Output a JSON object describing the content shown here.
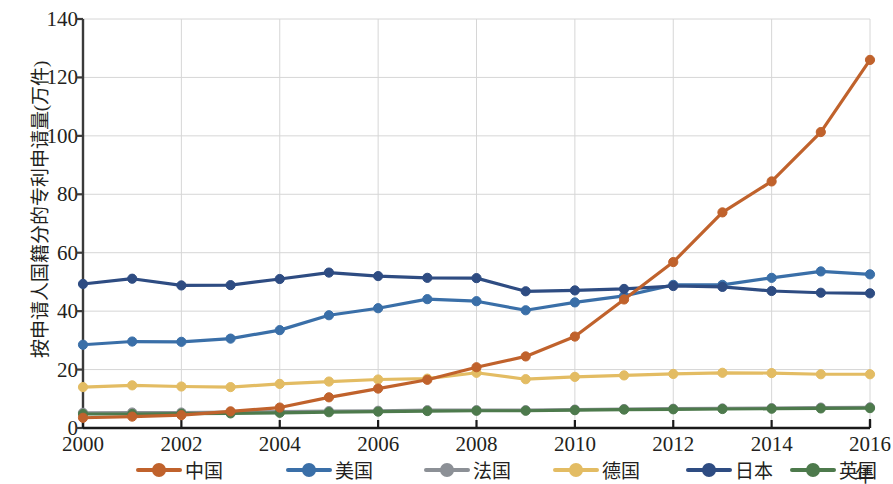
{
  "chart_data": {
    "type": "line",
    "title": "",
    "xlabel": "年",
    "ylabel": "按申请人国籍分的专利申请量(万件)",
    "x": [
      2000,
      2001,
      2002,
      2003,
      2004,
      2005,
      2006,
      2007,
      2008,
      2009,
      2010,
      2011,
      2012,
      2013,
      2014,
      2015,
      2016
    ],
    "xlim": [
      2000,
      2016
    ],
    "ylim": [
      0,
      140
    ],
    "xticks": [
      "2000",
      "2002",
      "2004",
      "2006",
      "2008",
      "2010",
      "2012",
      "2014",
      "2016"
    ],
    "xtick_values": [
      2000,
      2002,
      2004,
      2006,
      2008,
      2010,
      2012,
      2014,
      2016
    ],
    "yticks": [
      "0",
      "20",
      "40",
      "60",
      "80",
      "100",
      "120",
      "140"
    ],
    "ytick_values": [
      0,
      20,
      40,
      60,
      80,
      100,
      120,
      140
    ],
    "grid": true,
    "legend_position": "bottom",
    "series": [
      {
        "name": "中国",
        "color": "#C0622C",
        "values": [
          3.5,
          3.9,
          4.4,
          5.7,
          7.0,
          10.5,
          13.5,
          16.5,
          20.8,
          24.5,
          31.3,
          44.0,
          56.8,
          73.8,
          84.4,
          101.3,
          126.0
        ]
      },
      {
        "name": "美国",
        "color": "#3A6FA8",
        "values": [
          28.5,
          29.6,
          29.5,
          30.6,
          33.5,
          38.6,
          41.0,
          44.1,
          43.4,
          40.3,
          43.0,
          45.2,
          49.0,
          49.0,
          51.4,
          53.6,
          52.6
        ]
      },
      {
        "name": "法国",
        "color": "#8C9096",
        "values": [
          5.2,
          5.3,
          5.3,
          5.4,
          5.6,
          5.8,
          5.9,
          6.1,
          6.1,
          6.1,
          6.3,
          6.5,
          6.6,
          6.7,
          6.8,
          7.0,
          7.1
        ]
      },
      {
        "name": "德国",
        "color": "#E2B košt"
      }
    ]
  }
}
